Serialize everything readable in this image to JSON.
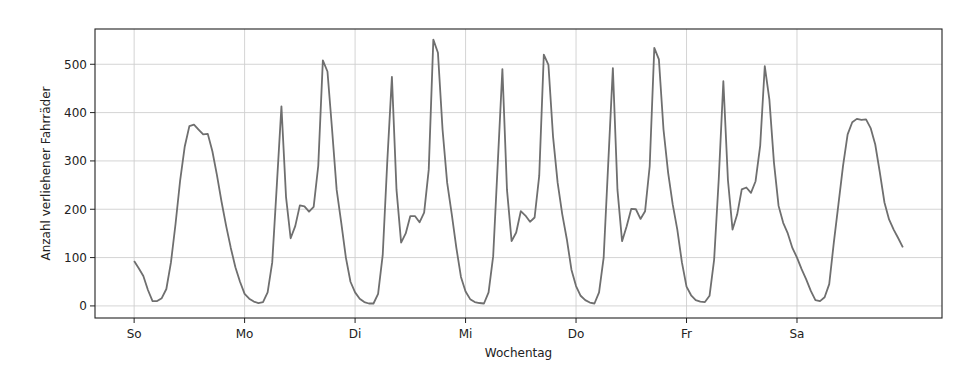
{
  "chart_data": {
    "type": "line",
    "title": "",
    "xlabel": "Wochentag",
    "ylabel": "Anzahl verliehener Fahrräder",
    "xtick_labels": [
      "So",
      "Mo",
      "Di",
      "Mi",
      "Do",
      "Fr",
      "Sa"
    ],
    "xtick_positions": [
      0,
      24,
      48,
      72,
      96,
      120,
      144
    ],
    "ytick_labels": [
      "0",
      "100",
      "200",
      "300",
      "400",
      "500"
    ],
    "yticks": [
      0,
      100,
      200,
      300,
      400,
      500
    ],
    "xlim": [
      -8.5,
      175.5
    ],
    "ylim": [
      -25,
      573
    ],
    "grid": true,
    "legend": null,
    "line_color": "#6f6f6f",
    "x_unit": "hour of week (0 = Sunday 00:00)",
    "series": [
      {
        "name": "Ausleihen pro Stunde",
        "values": [
          93,
          78,
          62,
          33,
          10,
          10,
          16,
          35,
          90,
          170,
          260,
          330,
          372,
          375,
          365,
          355,
          356,
          320,
          270,
          215,
          165,
          120,
          80,
          50,
          25,
          15,
          9,
          6,
          8,
          28,
          90,
          250,
          413,
          225,
          140,
          165,
          208,
          206,
          195,
          205,
          290,
          508,
          485,
          365,
          240,
          172,
          100,
          50,
          28,
          15,
          8,
          5,
          5,
          25,
          105,
          300,
          474,
          240,
          131,
          150,
          186,
          186,
          173,
          193,
          282,
          551,
          524,
          365,
          255,
          190,
          120,
          60,
          30,
          14,
          8,
          6,
          5,
          28,
          103,
          296,
          490,
          240,
          134,
          152,
          196,
          187,
          174,
          183,
          269,
          520,
          499,
          351,
          255,
          190,
          138,
          75,
          41,
          21,
          12,
          7,
          5,
          28,
          100,
          296,
          492,
          240,
          134,
          165,
          201,
          200,
          180,
          196,
          289,
          534,
          510,
          365,
          276,
          210,
          158,
          90,
          40,
          22,
          12,
          9,
          8,
          21,
          96,
          262,
          465,
          260,
          158,
          189,
          241,
          245,
          234,
          258,
          331,
          496,
          427,
          296,
          207,
          172,
          150,
          120,
          100,
          76,
          55,
          31,
          12,
          10,
          18,
          45,
          131,
          210,
          290,
          355,
          380,
          387,
          385,
          386,
          368,
          334,
          276,
          214,
          179,
          158,
          140,
          121
        ]
      }
    ]
  }
}
